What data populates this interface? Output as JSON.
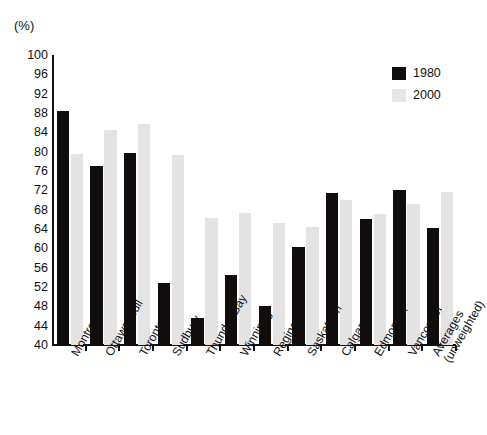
{
  "chart_data": {
    "type": "bar",
    "title": "",
    "xlabel": "",
    "ylabel": "(%)",
    "unit_label": "(%)",
    "ylim": [
      40,
      100
    ],
    "ytick_step": 4,
    "yticks": [
      100,
      96,
      92,
      88,
      84,
      80,
      76,
      72,
      68,
      64,
      60,
      56,
      52,
      48,
      44,
      40
    ],
    "grid": false,
    "legend_position": "top-right",
    "categories": [
      "Montreal",
      "Ottawa-Hull",
      "Toronto",
      "Sudbury",
      "Thunder Bay",
      "Winnipeg",
      "Regina",
      "Saskatoon",
      "Calgary",
      "Edmonton",
      "Vancouver",
      "Averages (unweighted)"
    ],
    "series": [
      {
        "name": "1980",
        "color": "#100d0c",
        "values": [
          88.5,
          77.0,
          79.7,
          52.8,
          45.5,
          54.5,
          48.0,
          60.3,
          71.5,
          66.0,
          72.0,
          64.3
        ]
      },
      {
        "name": "2000",
        "color": "#e3e3e3",
        "values": [
          79.5,
          84.5,
          85.7,
          79.3,
          66.2,
          67.3,
          65.3,
          64.5,
          70.0,
          67.2,
          69.2,
          71.6
        ]
      }
    ]
  },
  "legend": {
    "items": [
      {
        "label": "1980",
        "color": "#100d0c"
      },
      {
        "label": "2000",
        "color": "#e6e6e6"
      }
    ]
  }
}
